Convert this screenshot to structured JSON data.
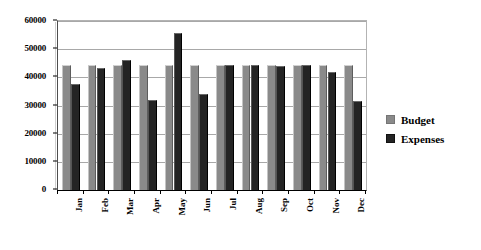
{
  "chart_data": {
    "type": "bar",
    "title": "",
    "subtitle": "",
    "xlabel": "",
    "ylabel": "",
    "categories": [
      "Jan",
      "Feb",
      "Mar",
      "Apr",
      "May",
      "Jun",
      "Jul",
      "Aug",
      "Sep",
      "Oct",
      "Nov",
      "Dec"
    ],
    "series": [
      {
        "name": "Budget",
        "color": "#8a8a8a",
        "values": [
          44500,
          44500,
          44500,
          44500,
          44500,
          44500,
          44500,
          44500,
          44500,
          44500,
          44500,
          44500
        ]
      },
      {
        "name": "Expenses",
        "color": "#242424",
        "values": [
          37700,
          43200,
          46200,
          32000,
          55800,
          34200,
          44500,
          44500,
          44000,
          44500,
          42000,
          31500
        ]
      }
    ],
    "ylim": [
      0,
      60000
    ],
    "ytick_values": [
      0,
      10000,
      20000,
      30000,
      40000,
      50000,
      60000
    ],
    "ytick_labels": [
      "0",
      "10000",
      "20000",
      "30000",
      "40000",
      "50000",
      "60000"
    ],
    "grid": true,
    "grid_axis": "y",
    "legend_position": "right",
    "legend": [
      {
        "label": "Budget",
        "swatch": "budget"
      },
      {
        "label": "Expenses",
        "swatch": "expenses"
      }
    ]
  }
}
